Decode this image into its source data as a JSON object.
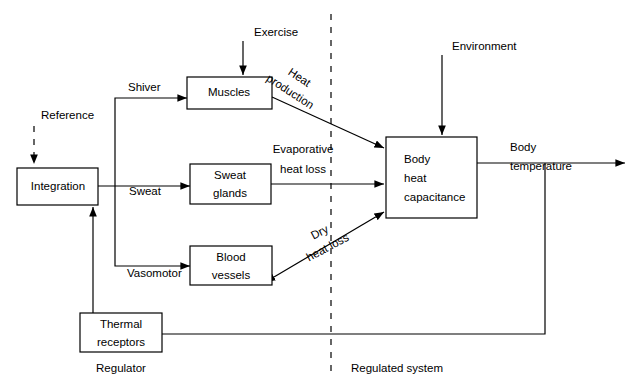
{
  "diagram": {
    "colors": {
      "line": "#000000",
      "background": "#ffffff",
      "text": "#000000"
    },
    "boxes": [
      {
        "id": "integration",
        "label_lines": [
          "Integration"
        ],
        "x": 17,
        "y": 168,
        "w": 81,
        "h": 37
      },
      {
        "id": "muscles",
        "label_lines": [
          "Muscles"
        ],
        "x": 187,
        "y": 77,
        "w": 85,
        "h": 32
      },
      {
        "id": "sweat-glands",
        "label_lines": [
          "Sweat",
          "glands"
        ],
        "x": 190,
        "y": 164,
        "w": 81,
        "h": 40
      },
      {
        "id": "blood-vessels",
        "label_lines": [
          "Blood",
          "vessels"
        ],
        "x": 190,
        "y": 246,
        "w": 82,
        "h": 39
      },
      {
        "id": "thermal-receptors",
        "label_lines": [
          "Thermal",
          "receptors"
        ],
        "x": 80,
        "y": 313,
        "w": 82,
        "h": 39
      },
      {
        "id": "body-heat-capacitance",
        "label_lines": [
          "Body",
          "heat",
          "capacitance"
        ],
        "x": 386,
        "y": 137,
        "w": 91,
        "h": 81
      }
    ],
    "labels": {
      "reference": "Reference",
      "shiver": "Shiver",
      "sweat": "Sweat",
      "vasomotor": "Vasomotor",
      "exercise": "Exercise",
      "environment": "Environment",
      "heat_production_line1": "Heat",
      "heat_production_line2": "production",
      "evaporative_line1": "Evaporative",
      "evaporative_line2": "heat loss",
      "dry_line1": "Dry",
      "dry_line2": "heat loss",
      "body_temperature_line1": "Body",
      "body_temperature_line2": "temperature",
      "regulator": "Regulator",
      "regulated_system": "Regulated system"
    },
    "box_text": {
      "integration": "Integration",
      "muscles": "Muscles",
      "sweat_glands_1": "Sweat",
      "sweat_glands_2": "glands",
      "blood_vessels_1": "Blood",
      "blood_vessels_2": "vessels",
      "thermal_receptors_1": "Thermal",
      "thermal_receptors_2": "receptors",
      "body_heat_1": "Body",
      "body_heat_2": "heat",
      "body_heat_3": "capacitance"
    },
    "divider": {
      "name": "regulator-regulated-system-divider",
      "style": "dashed",
      "x": 331,
      "y1": 14,
      "y2": 376
    }
  }
}
